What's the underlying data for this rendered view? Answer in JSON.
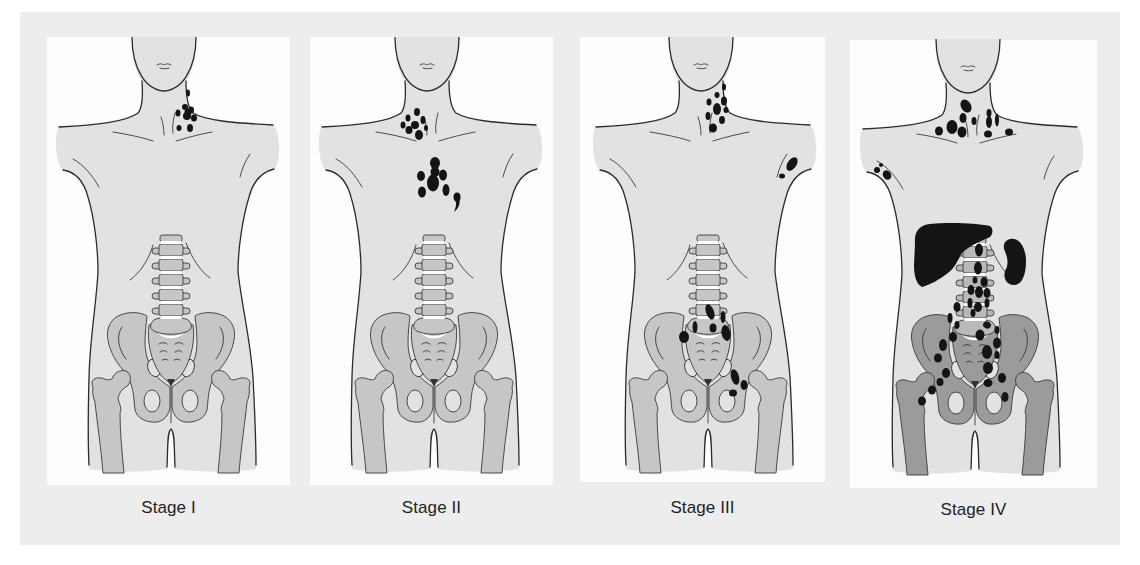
{
  "colors": {
    "page": "#ffffff",
    "backdrop": "#ededed",
    "panel": "#fdfdfd",
    "skin": "#e2e2e2",
    "outline": "#2b2b2b",
    "lesion": "#141414",
    "label_text": "#222222"
  },
  "panels": [
    {
      "label": "Stage I",
      "bone_color": "#c6c6c6",
      "spine_color": "#c6c6c6",
      "lesions": [
        [
          142,
          56,
          2,
          3.5,
          0
        ],
        [
          139,
          70,
          3,
          3,
          0
        ],
        [
          145,
          73,
          3,
          3.5,
          0
        ],
        [
          141,
          79,
          4,
          4,
          0
        ],
        [
          148,
          81,
          3,
          3.5,
          0
        ],
        [
          132,
          76,
          2.5,
          3.5,
          0
        ],
        [
          133,
          91,
          2.5,
          3,
          0
        ],
        [
          144,
          91,
          3,
          4,
          0
        ],
        [
          142,
          75,
          3.5,
          3.5,
          0
        ]
      ],
      "lesion_paths": [],
      "organs": []
    },
    {
      "label": "Stage II",
      "bone_color": "#c6c6c6",
      "spine_color": "#c6c6c6",
      "lesions": [
        [
          108,
          75,
          3,
          4,
          0
        ],
        [
          99,
          81,
          2.5,
          3.5,
          0
        ],
        [
          114,
          83,
          2.5,
          4,
          0
        ],
        [
          106,
          88,
          4,
          4,
          0
        ],
        [
          94,
          88,
          2.5,
          3.5,
          0
        ],
        [
          100,
          93,
          3.5,
          4,
          0
        ],
        [
          110,
          98,
          4,
          5,
          0
        ],
        [
          117,
          91,
          2,
          3,
          0
        ],
        [
          126,
          126,
          5,
          6,
          0
        ],
        [
          126,
          135,
          4.5,
          5,
          0
        ],
        [
          134,
          138,
          4,
          5.5,
          0
        ],
        [
          112,
          139,
          4,
          5,
          0
        ],
        [
          124,
          146,
          6,
          8.5,
          0
        ],
        [
          113,
          155,
          4,
          5.5,
          0
        ],
        [
          137,
          153,
          3.5,
          6,
          0
        ],
        [
          148,
          160,
          3.5,
          4.5,
          0
        ]
      ],
      "lesion_paths": [
        "M150,161 C152,167 149,172 145,175 C147,170 148,166 146,163 Z"
      ],
      "organs": []
    },
    {
      "label": "Stage III",
      "bone_color": "#c6c6c6",
      "spine_color": "#c6c6c6",
      "lesions": [
        [
          141,
          50,
          2,
          3.5,
          0
        ],
        [
          134,
          58,
          2.5,
          3,
          0
        ],
        [
          141,
          64,
          3,
          4.5,
          0
        ],
        [
          126,
          65,
          2.5,
          3.5,
          0
        ],
        [
          134,
          72,
          4,
          6,
          0
        ],
        [
          143,
          73,
          2.5,
          3,
          0
        ],
        [
          125,
          79,
          2.5,
          4,
          0
        ],
        [
          139,
          83,
          3,
          4,
          0
        ],
        [
          130,
          91,
          4,
          4.5,
          0
        ],
        [
          209,
          127,
          4.5,
          7.5,
          35
        ],
        [
          199,
          139,
          3,
          2.5,
          0
        ],
        [
          127,
          275,
          4,
          8,
          -20
        ],
        [
          140,
          280,
          2.5,
          6,
          0
        ],
        [
          112,
          290,
          2.5,
          6,
          0
        ],
        [
          130,
          291,
          3.5,
          4.5,
          0
        ],
        [
          143,
          296,
          4.5,
          8,
          -10
        ],
        [
          101,
          300,
          5,
          6,
          0
        ],
        [
          152,
          340,
          4,
          8,
          -15
        ],
        [
          161,
          348,
          3.5,
          5,
          0
        ],
        [
          150,
          356,
          4,
          3.5,
          0
        ]
      ],
      "lesion_paths": [],
      "organs": []
    },
    {
      "label": "Stage IV",
      "bone_color": "#9b9b9b",
      "spine_color": "#b9b9b9",
      "lesions": [
        [
          116,
          67,
          5,
          7,
          -30
        ],
        [
          113,
          79,
          3.5,
          5,
          0
        ],
        [
          124,
          82,
          2.5,
          4,
          0
        ],
        [
          102,
          88,
          5.5,
          7,
          0
        ],
        [
          112,
          93,
          4.5,
          5.5,
          0
        ],
        [
          89,
          92,
          4,
          4.5,
          0
        ],
        [
          139,
          74,
          2.5,
          4,
          0
        ],
        [
          139,
          83,
          3,
          6,
          0
        ],
        [
          147,
          81,
          2,
          6.5,
          0
        ],
        [
          138,
          95,
          4,
          3.5,
          0
        ],
        [
          159,
          93,
          4,
          3.5,
          0
        ],
        [
          27,
          131,
          3,
          3,
          0
        ],
        [
          37,
          136,
          4,
          5,
          -30
        ],
        [
          31,
          126,
          2,
          2,
          0
        ],
        [
          129,
          211,
          4,
          6.5,
          0
        ],
        [
          128,
          229,
          4,
          6.5,
          0
        ],
        [
          125,
          241,
          2.5,
          3.5,
          0
        ],
        [
          134,
          243,
          3.5,
          5,
          0
        ],
        [
          121,
          251,
          3.5,
          5,
          0
        ],
        [
          129,
          253,
          4,
          6,
          0
        ],
        [
          137,
          254,
          3.5,
          5,
          0
        ],
        [
          120,
          264,
          2.5,
          5,
          0
        ],
        [
          107,
          268,
          3.5,
          5,
          0
        ],
        [
          128,
          268,
          4,
          5,
          0
        ],
        [
          137,
          264,
          2.5,
          4.5,
          0
        ],
        [
          123,
          274,
          2.5,
          4,
          0
        ],
        [
          100,
          279,
          2.5,
          5,
          0
        ],
        [
          107,
          286,
          2.5,
          4,
          0
        ],
        [
          137,
          286,
          4,
          3.5,
          30
        ],
        [
          147,
          291,
          2.5,
          4,
          0
        ],
        [
          103,
          298,
          4,
          5,
          0
        ],
        [
          130,
          296,
          4.5,
          5.5,
          0
        ],
        [
          147,
          304,
          4,
          5.5,
          0
        ],
        [
          93,
          306,
          4,
          6,
          0
        ],
        [
          137,
          313,
          5,
          7,
          0
        ],
        [
          88,
          319,
          4,
          4.5,
          0
        ],
        [
          147,
          316,
          2.5,
          4,
          0
        ],
        [
          138,
          329,
          5,
          6,
          0
        ],
        [
          96,
          334,
          4,
          5,
          0
        ],
        [
          152,
          339,
          4,
          5,
          0
        ],
        [
          138,
          344,
          4.5,
          4,
          0
        ],
        [
          90,
          343,
          3.5,
          4,
          0
        ],
        [
          82,
          351,
          4,
          4.5,
          0
        ],
        [
          155,
          358,
          3.5,
          5,
          0
        ],
        [
          72,
          362,
          4,
          4.5,
          0
        ]
      ],
      "lesion_paths": [],
      "organs": [
        {
          "name": "liver",
          "path": "M65,204 C64,192 70,186 80,185 C100,183 125,184 140,187 C144,190 143,197 138,199 C128,203 118,208 112,214 C108,220 106,228 98,234 C90,240 80,246 72,248 C66,245 64,236 64,226 Z"
        },
        {
          "name": "spleen",
          "path": "M160,200 C170,198 176,210 176,222 C176,236 172,246 164,246 C156,246 152,238 156,230 C159,224 157,216 154,210 C153,204 156,201 160,200 Z"
        }
      ]
    }
  ]
}
